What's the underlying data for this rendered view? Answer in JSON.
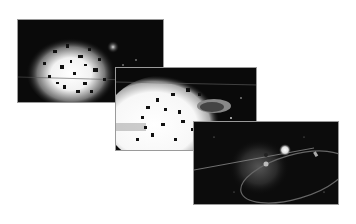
{
  "figure": {
    "frames": [
      {
        "id": "frame-1",
        "subject": "explosion with scattered debris fragments",
        "tone": "grayscale"
      },
      {
        "id": "frame-2",
        "subject": "bright expanding explosion with debris and a saucer-shaped object",
        "tone": "grayscale"
      },
      {
        "id": "frame-3",
        "subject": "nebula with a bright star and an elliptical ring arc",
        "tone": "grayscale"
      }
    ]
  },
  "colors": {
    "background": "#ffffff",
    "frame_bg": "#0a0a0a",
    "highlight": "#ffffff"
  }
}
